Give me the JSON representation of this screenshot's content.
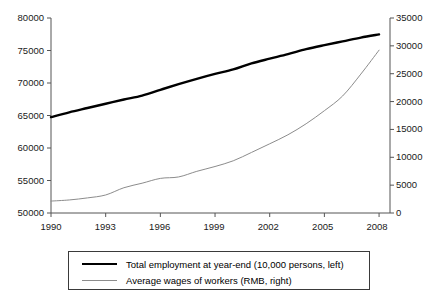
{
  "chart_data": {
    "type": "line",
    "title": "",
    "subtitle": "",
    "xlabel": "",
    "ylabel": "",
    "grid": false,
    "legend_position": "bottom",
    "x": [
      1990,
      1991,
      1992,
      1993,
      1994,
      1995,
      1996,
      1997,
      1998,
      1999,
      2000,
      2001,
      2002,
      2003,
      2004,
      2005,
      2006,
      2007,
      2008
    ],
    "xlim": [
      1990,
      2008.6
    ],
    "xticks": [
      1990,
      1993,
      1996,
      1999,
      2002,
      2005,
      2008
    ],
    "xtick_labels": [
      "1990",
      "1993",
      "1996",
      "1999",
      "2002",
      "2005",
      "2008"
    ],
    "axes": [
      {
        "id": "left",
        "label": "Total employment at year-end (10,000 persons)",
        "ylim": [
          50000,
          80000
        ],
        "yticks": [
          50000,
          55000,
          60000,
          65000,
          70000,
          75000,
          80000
        ],
        "ytick_labels": [
          "50000",
          "55000",
          "60000",
          "65000",
          "70000",
          "75000",
          "80000"
        ]
      },
      {
        "id": "right",
        "label": "Average wages of workers (RMB)",
        "ylim": [
          0,
          35000
        ],
        "yticks": [
          0,
          5000,
          10000,
          15000,
          20000,
          25000,
          30000,
          35000
        ],
        "ytick_labels": [
          "0",
          "5000",
          "10000",
          "15000",
          "20000",
          "25000",
          "30000",
          "35000"
        ]
      }
    ],
    "series": [
      {
        "name": "Total employment at year-end (10,000 persons, left)",
        "axis": "left",
        "color": "#000000",
        "line_width": 2.4,
        "values": [
          64749,
          65491,
          66152,
          66808,
          67455,
          68065,
          68950,
          69820,
          70637,
          71394,
          72085,
          73025,
          73740,
          74432,
          75200,
          75825,
          76400,
          76990,
          77480
        ]
      },
      {
        "name": "Average wages of workers (RMB, right)",
        "axis": "right",
        "color": "#8c8c8c",
        "line_width": 1.0,
        "values": [
          2140,
          2340,
          2711,
          3236,
          4538,
          5348,
          6210,
          6470,
          7479,
          8346,
          9371,
          10870,
          12422,
          14040,
          16024,
          18364,
          21001,
          24932,
          29229
        ]
      }
    ],
    "legend": [
      {
        "label": "Total employment at year-end (10,000 persons, left)",
        "color": "#000000",
        "style": "thick"
      },
      {
        "label": "Average wages of workers (RMB, right)",
        "color": "#8c8c8c",
        "style": "thin"
      }
    ]
  },
  "axis_left": {
    "t0": "50000",
    "t1": "55000",
    "t2": "60000",
    "t3": "65000",
    "t4": "70000",
    "t5": "75000",
    "t6": "80000"
  },
  "axis_right": {
    "t0": "0",
    "t1": "5000",
    "t2": "10000",
    "t3": "15000",
    "t4": "20000",
    "t5": "25000",
    "t6": "30000",
    "t7": "35000"
  },
  "axis_x": {
    "t0": "1990",
    "t1": "1993",
    "t2": "1996",
    "t3": "1999",
    "t4": "2002",
    "t5": "2005",
    "t6": "2008"
  },
  "legend": {
    "series_1": "Total employment at year-end (10,000 persons, left)",
    "series_2": "Average wages of workers (RMB, right)"
  }
}
